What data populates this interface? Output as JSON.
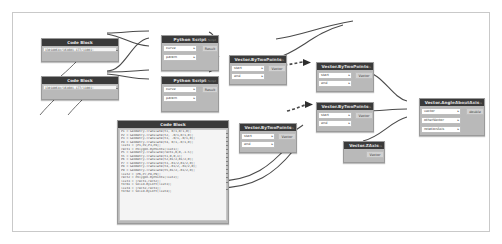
{
  "app": {
    "name": "dynamo-node-graph",
    "canvas_background": "#ffffff",
    "node_header_color": "#3a3a3a",
    "node_body_color": "#b9b9b9",
    "wire_color": "#4a4a4a"
  },
  "nodes": [
    {
      "id": "code-block-1",
      "type": "code-block",
      "title": "Code Block",
      "code_lines": [
        "13018064x/164601.177/11001;"
      ],
      "x": 28,
      "y": 25,
      "w": 78,
      "h": 24
    },
    {
      "id": "code-block-2",
      "type": "code-block",
      "title": "Code Block",
      "code_lines": [
        "13018064x/164601.177/11001;"
      ],
      "x": 28,
      "y": 63,
      "w": 78,
      "h": 24
    },
    {
      "id": "python-script-1",
      "type": "node",
      "title": "Python Script",
      "inputs": [
        {
          "label": "curve",
          "caret": "▸"
        },
        {
          "label": "param",
          "caret": "▸"
        }
      ],
      "outputs": [
        {
          "label": "Result"
        }
      ],
      "footer": "Python Script",
      "x": 148,
      "y": 22,
      "w": 58,
      "h": 36
    },
    {
      "id": "python-script-2",
      "type": "node",
      "title": "Python Script",
      "inputs": [
        {
          "label": "curve",
          "caret": "▸"
        },
        {
          "label": "param",
          "caret": "▸"
        }
      ],
      "outputs": [
        {
          "label": "Result"
        }
      ],
      "footer": "Python Script",
      "x": 148,
      "y": 63,
      "w": 58,
      "h": 36
    },
    {
      "id": "vector-bytwopoints-1",
      "type": "node",
      "title": "Vector.ByTwoPoints",
      "inputs": [
        {
          "label": "start",
          "caret": "▸"
        },
        {
          "label": "end",
          "caret": "▸"
        }
      ],
      "outputs": [
        {
          "label": "Vector"
        }
      ],
      "footer": "Vector.ByTwoPoints",
      "x": 216,
      "y": 42,
      "w": 58,
      "h": 30
    },
    {
      "id": "vector-bytwopoints-2",
      "type": "node",
      "title": "Vector.ByTwoPoints",
      "inputs": [
        {
          "label": "start",
          "caret": "▸"
        },
        {
          "label": "end",
          "caret": "▸"
        }
      ],
      "outputs": [
        {
          "label": "Vector"
        }
      ],
      "footer": "Vector.ByTwoPoints",
      "x": 303,
      "y": 49,
      "w": 58,
      "h": 30
    },
    {
      "id": "vector-bytwopoints-3",
      "type": "node",
      "title": "Vector.ByTwoPoints",
      "inputs": [
        {
          "label": "start",
          "caret": "▸"
        },
        {
          "label": "end",
          "caret": "▸"
        }
      ],
      "outputs": [
        {
          "label": "Vector"
        }
      ],
      "footer": "Vector.ByTwoPoints",
      "x": 303,
      "y": 89,
      "w": 58,
      "h": 30
    },
    {
      "id": "vector-bytwopoints-4",
      "type": "node",
      "title": "Vector.ByTwoPoints",
      "inputs": [
        {
          "label": "start",
          "caret": "▸"
        },
        {
          "label": "end",
          "caret": "▸"
        }
      ],
      "outputs": [
        {
          "label": "Vector"
        }
      ],
      "footer": "Vector.ByTwoPoints",
      "x": 226,
      "y": 110,
      "w": 58,
      "h": 30
    },
    {
      "id": "vector-zaxis",
      "type": "node",
      "title": "Vector.ZAxis",
      "inputs": [],
      "outputs": [
        {
          "label": "Vector"
        }
      ],
      "footer": "Vector.ZAxis",
      "x": 330,
      "y": 128,
      "w": 42,
      "h": 22
    },
    {
      "id": "vector-angleaboutaxis",
      "type": "node",
      "title": "Vector.AngleAboutAxis",
      "inputs": [
        {
          "label": "vector",
          "caret": "▸"
        },
        {
          "label": "otherVector",
          "caret": "▸"
        },
        {
          "label": "rotationAxis",
          "caret": "▸"
        }
      ],
      "outputs": [
        {
          "label": "double"
        }
      ],
      "footer": "Vector.AngleAboutAxis",
      "x": 406,
      "y": 85,
      "w": 66,
      "h": 38
    },
    {
      "id": "code-block-3",
      "type": "code-block",
      "title": "Code Block",
      "code_lines": [
        "P1 = Geometry.Translate(t1, 0/1,0/1,0);",
        "P2 = Geometry.Translate(t2, -0/1,0/1,0);",
        "P3 = Geometry.Translate(t3, -0/1,-0/1,0);",
        "P4 = Geometry.Translate(t4, 0/1,-0/1,0);",
        "list1 = [P1,P2,P3,P4];",
        "rect1 = Polygon.ByPoints(list1);",
        "P5 = Geometry.Translate(rect1,0,0,-1.5);",
        "t5 = Geometry.Translate(t1,0,0,1);",
        "P6 = Geometry.Translate(t2,B1/2,B1/2,0);",
        "P7 = Geometry.Translate(t3,-B1/2,B1/2,0);",
        "P8 = Geometry.Translate(t4,-B1/2,-B1/2,0);",
        "P9 = Geometry.Translate(t5,B1/2,-B1/2,0);",
        "list2 = [P6,P7,P8,P9];",
        "rect2 = Polygon.ByPoints(list2);",
        "list3 = [rect1,rect2];",
        "form1 = Solid.ByLoft(list3);",
        "list4 = [rect2,rect3];",
        "form2 = Solid.ByLoft(list4);"
      ],
      "x": 104,
      "y": 107,
      "w": 112,
      "h": 104
    }
  ],
  "wires": [
    {
      "id": "w-cb1-to-py1-curve",
      "from": "code-block-1",
      "to": "python-script-1"
    },
    {
      "id": "w-cb1-to-py2-curve",
      "from": "code-block-1",
      "to": "python-script-2"
    },
    {
      "id": "w-cb2-to-py1-param",
      "from": "code-block-2",
      "to": "python-script-1"
    },
    {
      "id": "w-cb2-to-py2-param",
      "from": "code-block-2",
      "to": "python-script-2"
    },
    {
      "id": "w-py1-to-vbtp1",
      "from": "python-script-1",
      "to": "vector-bytwopoints-1"
    },
    {
      "id": "w-py2-to-vbtp1",
      "from": "python-script-2",
      "to": "vector-bytwopoints-1"
    },
    {
      "id": "w-vbtp1-to-vbtp2",
      "from": "vector-bytwopoints-1",
      "to": "vector-bytwopoints-2"
    },
    {
      "id": "w-vbtp4-to-vbtp3",
      "from": "vector-bytwopoints-4",
      "to": "vector-bytwopoints-3"
    },
    {
      "id": "w-vbtp2-to-angle",
      "from": "vector-bytwopoints-2",
      "to": "vector-angleaboutaxis"
    },
    {
      "id": "w-vbtp3-to-angle",
      "from": "vector-bytwopoints-3",
      "to": "vector-angleaboutaxis"
    },
    {
      "id": "w-zaxis-to-angle",
      "from": "vector-zaxis",
      "to": "vector-angleaboutaxis"
    },
    {
      "id": "w-cb3-to-vbtp4",
      "from": "code-block-3",
      "to": "vector-bytwopoints-4"
    }
  ]
}
